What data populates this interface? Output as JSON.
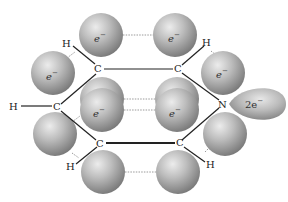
{
  "diagram": {
    "type": "molecular-orbital-diagram",
    "molecule": "pyridine",
    "colors": {
      "sphere_light": "#e6e6e6",
      "sphere_mid": "#b4b4b4",
      "sphere_dark": "#7a7a7a",
      "bond": "#222222",
      "dotted_line": "#999999"
    },
    "atoms": [
      {
        "id": "H1",
        "label": "H",
        "x": 67,
        "y": 46
      },
      {
        "id": "H2",
        "label": "H",
        "x": 207,
        "y": 45
      },
      {
        "id": "C1",
        "label": "C",
        "x": 98,
        "y": 72
      },
      {
        "id": "C2",
        "label": "C",
        "x": 178,
        "y": 72
      },
      {
        "id": "H3",
        "label": "H",
        "x": 14,
        "y": 110
      },
      {
        "id": "C3",
        "label": "C",
        "x": 57,
        "y": 110
      },
      {
        "id": "N",
        "label": "N",
        "x": 223,
        "y": 106
      },
      {
        "id": "C4",
        "label": "C",
        "x": 100,
        "y": 146
      },
      {
        "id": "C5",
        "label": "C",
        "x": 180,
        "y": 146
      },
      {
        "id": "H4",
        "label": "H",
        "x": 70,
        "y": 169
      },
      {
        "id": "H5",
        "label": "H",
        "x": 210,
        "y": 168
      }
    ],
    "electron_labels": {
      "e": "e",
      "minus": "−",
      "lone_pair_coef": "2e",
      "lone_pair_minus": "−"
    },
    "spheres": [
      {
        "id": "top-left",
        "cx": 101,
        "cy": 35,
        "r": 22,
        "label": true
      },
      {
        "id": "top-right",
        "cx": 175,
        "cy": 35,
        "r": 22,
        "label": true
      },
      {
        "id": "upper-left",
        "cx": 53,
        "cy": 73,
        "r": 22,
        "label": true
      },
      {
        "id": "upper-right",
        "cx": 223,
        "cy": 73,
        "r": 22,
        "label": true
      },
      {
        "id": "mid-left",
        "cx": 102,
        "cy": 110,
        "r": 22,
        "label": true
      },
      {
        "id": "mid-right",
        "cx": 177,
        "cy": 110,
        "r": 22,
        "label": true
      },
      {
        "id": "lower-left",
        "cx": 55,
        "cy": 134,
        "r": 22,
        "label": false
      },
      {
        "id": "lower-right",
        "cx": 225,
        "cy": 134,
        "r": 22,
        "label": false
      },
      {
        "id": "bottom-left",
        "cx": 103,
        "cy": 172,
        "r": 22,
        "label": false
      },
      {
        "id": "bottom-right",
        "cx": 178,
        "cy": 172,
        "r": 22,
        "label": false
      }
    ]
  }
}
